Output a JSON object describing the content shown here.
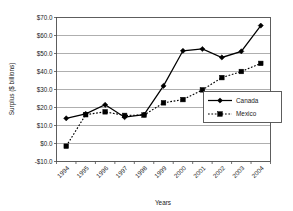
{
  "chart_data": {
    "type": "line",
    "title": "",
    "xlabel": "Years",
    "ylabel": "Surplus ($ billions)",
    "categories": [
      "1994",
      "1995",
      "1996",
      "1997",
      "1998",
      "1999",
      "2000",
      "2001",
      "2002",
      "2003",
      "2004"
    ],
    "ylim": [
      -10.0,
      70.0
    ],
    "ytick_labels": [
      "$70.0",
      "$60.0",
      "$50.0",
      "$40.0",
      "$30.0",
      "$20.0",
      "$10.0",
      "$0.0",
      "-$10.0"
    ],
    "ytick_values": [
      70.0,
      60.0,
      50.0,
      40.0,
      30.0,
      20.0,
      10.0,
      0.0,
      -10.0
    ],
    "grid": true,
    "legend_position": "center-right",
    "series": [
      {
        "name": "Canada",
        "marker": "diamond",
        "line_style": "solid",
        "color": "#000000",
        "values": [
          14.0,
          16.5,
          21.5,
          14.6,
          16.0,
          32.0,
          51.5,
          52.5,
          47.8,
          51.2,
          65.5
        ]
      },
      {
        "name": "Mexico",
        "marker": "square",
        "line_style": "dotted",
        "color": "#000000",
        "values": [
          -1.5,
          16.0,
          17.6,
          15.6,
          15.8,
          22.6,
          24.4,
          29.8,
          36.6,
          40.0,
          44.5
        ]
      }
    ]
  },
  "axis": {
    "x_title": "Years",
    "y_title": "Surplus ($ billions)"
  },
  "legend": {
    "items": [
      {
        "label": "Canada"
      },
      {
        "label": "Mexico"
      }
    ]
  }
}
